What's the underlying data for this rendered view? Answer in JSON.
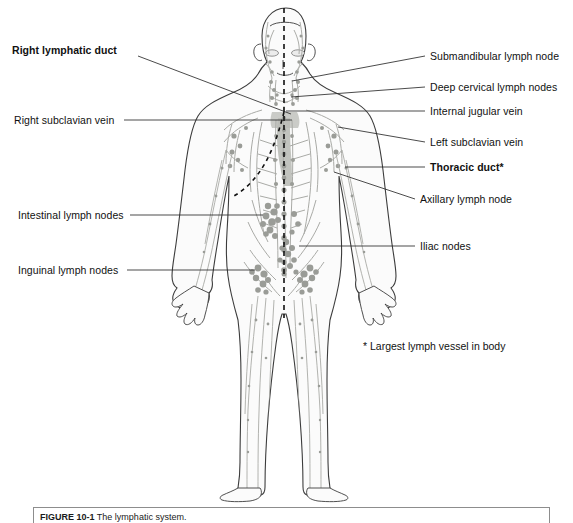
{
  "figure": {
    "title_prefix": "FIGURE 10-1",
    "caption": "The lymphatic system.",
    "footnote": "* Largest lymph vessel in body",
    "view": "anterior whole-body view of the human lymphatic system"
  },
  "colors": {
    "background": "#ffffff",
    "body_outline": "#3c3c3c",
    "body_fill": "#fbfbfb",
    "lymph_vessel": "#a9aaa6",
    "lymph_node": "#9a9c97",
    "duct_shading": "#b6b8b3",
    "leader_line": "#2a2a2a",
    "midline_dashed": "#111111",
    "label_text": "#111111",
    "caption_border": "#8d8d8d"
  },
  "labels_left": [
    {
      "id": "right-lymphatic-duct",
      "text": "Right lymphatic duct",
      "bold": true,
      "text_x": 12,
      "text_y": 50,
      "line_start_x": 138,
      "line_start_y": 56,
      "line_end_x": 291,
      "line_end_y": 114
    },
    {
      "id": "right-subclavian-vein",
      "text": "Right subclavian vein",
      "bold": false,
      "text_x": 14,
      "text_y": 114,
      "line_start_x": 124,
      "line_start_y": 120,
      "line_end_x": 292,
      "line_end_y": 120
    },
    {
      "id": "intestinal-lymph-nodes",
      "text": "Intestinal lymph nodes",
      "bold": false,
      "text_x": 18,
      "text_y": 209,
      "line_start_x": 130,
      "line_start_y": 215,
      "line_end_x": 263,
      "line_end_y": 215
    },
    {
      "id": "inguinal-lymph-nodes",
      "text": "Inguinal lymph nodes",
      "bold": false,
      "text_x": 18,
      "text_y": 264,
      "line_start_x": 127,
      "line_start_y": 270,
      "line_end_x": 255,
      "line_end_y": 270
    }
  ],
  "labels_right": [
    {
      "id": "submandibular-lymph-node",
      "text": "Submandibular lymph node",
      "bold": false,
      "text_x": 430,
      "text_y": 50,
      "line_start_x": 425,
      "line_start_y": 56,
      "line_end_x": 292,
      "line_end_y": 81
    },
    {
      "id": "deep-cervical-lymph-nodes",
      "text": "Deep cervical lymph nodes",
      "bold": false,
      "text_x": 430,
      "text_y": 81,
      "line_start_x": 425,
      "line_start_y": 87,
      "line_end_x": 291,
      "line_end_y": 97
    },
    {
      "id": "internal-jugular-vein",
      "text": "Internal jugular vein",
      "bold": false,
      "text_x": 430,
      "text_y": 106,
      "line_start_x": 425,
      "line_start_y": 111,
      "line_end_x": 286,
      "line_end_y": 111
    },
    {
      "id": "left-subclavian-vein",
      "text": "Left subclavian vein",
      "bold": false,
      "text_x": 430,
      "text_y": 137,
      "line_start_x": 425,
      "line_start_y": 142,
      "line_end_x": 338,
      "line_end_y": 127
    },
    {
      "id": "thoracic-duct",
      "text": "Thoracic duct*",
      "bold": true,
      "text_x": 430,
      "text_y": 162,
      "line_start_x": 425,
      "line_start_y": 167,
      "line_end_x": 345,
      "line_end_y": 167
    },
    {
      "id": "axillary-lymph-node",
      "text": "Axillary lymph node",
      "bold": false,
      "text_x": 420,
      "text_y": 194,
      "line_start_x": 415,
      "line_start_y": 199,
      "line_end_x": 334,
      "line_end_y": 172
    },
    {
      "id": "iliac-nodes",
      "text": "Iliac nodes",
      "bold": false,
      "text_x": 420,
      "text_y": 240,
      "line_start_x": 415,
      "line_start_y": 246,
      "line_end_x": 299,
      "line_end_y": 246
    }
  ]
}
